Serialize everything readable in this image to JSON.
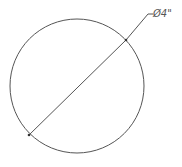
{
  "diagram": {
    "shape": "circle",
    "circle": {
      "cx": 77,
      "cy": 86,
      "r": 67,
      "stroke": "#555555"
    },
    "diameter_line": {
      "x1": 29,
      "y1": 135,
      "x2": 126,
      "y2": 40
    },
    "leader_line": {
      "x1": 126,
      "y1": 40,
      "x2": 148,
      "y2": 14,
      "x3": 153,
      "y3": 14
    },
    "dimension_label": "Ø4\"",
    "label_position": {
      "x": 153,
      "y": 17
    }
  }
}
